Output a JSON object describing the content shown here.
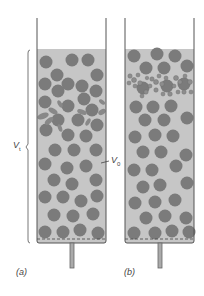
{
  "figure": {
    "panels": [
      {
        "id": "a",
        "label": "(a)",
        "description": "Packed bed of spheres with deformed particles in upper layer"
      },
      {
        "id": "b",
        "label": "(b)",
        "description": "Packed bed with fine aggregated particles trapped near top"
      }
    ],
    "annotations": {
      "v1_symbol": "V",
      "v1_sub": "t",
      "v0_symbol": "V",
      "v0_sub": "0"
    },
    "colors": {
      "liquid": "#c4c4c4",
      "sphere": "#7a7a7a",
      "wall": "#555555",
      "fine": "#8a8a8a"
    }
  }
}
